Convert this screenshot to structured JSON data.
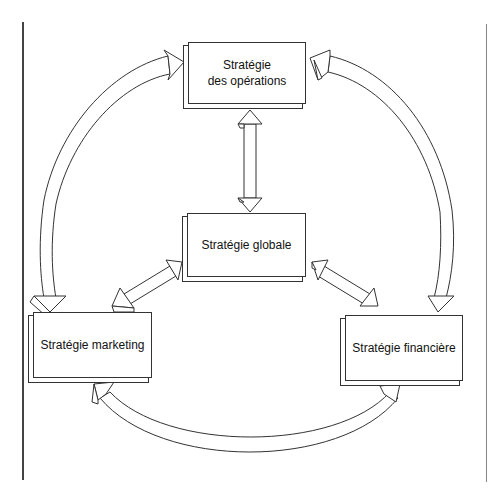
{
  "diagram": {
    "type": "strategy-relationship-diagram",
    "nodes": [
      {
        "id": "operations",
        "label": "Stratégie\ndes opérations"
      },
      {
        "id": "global",
        "label": "Stratégie globale"
      },
      {
        "id": "marketing",
        "label": "Stratégie marketing"
      },
      {
        "id": "finance",
        "label": "Stratégie financière"
      }
    ],
    "edges": [
      {
        "from": "marketing",
        "to": "operations",
        "style": "curved-arrow",
        "direction": "bidirectional"
      },
      {
        "from": "finance",
        "to": "operations",
        "style": "curved-arrow",
        "direction": "bidirectional"
      },
      {
        "from": "marketing",
        "to": "finance",
        "style": "curved-arrow",
        "direction": "bidirectional"
      },
      {
        "from": "global",
        "to": "operations",
        "style": "straight-double-arrow",
        "direction": "bidirectional"
      },
      {
        "from": "global",
        "to": "marketing",
        "style": "straight-double-arrow",
        "direction": "bidirectional"
      },
      {
        "from": "global",
        "to": "finance",
        "style": "straight-double-arrow",
        "direction": "bidirectional"
      }
    ],
    "colors": {
      "stroke": "#333333",
      "fill": "#ffffff",
      "text": "#111111"
    }
  }
}
